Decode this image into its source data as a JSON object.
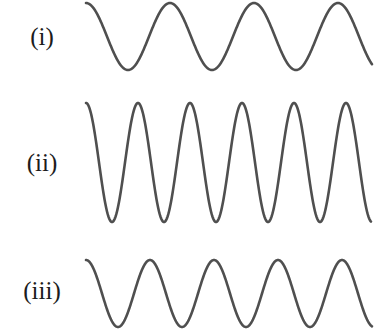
{
  "figure": {
    "width": 388,
    "height": 334,
    "background_color": "#ffffff",
    "stroke_color": "#4f4f4f",
    "label_color": "#1c1c1c",
    "stroke_width": 2.6
  },
  "labels": [
    {
      "id": "i",
      "text": "(i)"
    },
    {
      "id": "ii",
      "text": "(ii)"
    },
    {
      "id": "iii",
      "text": "(iii)"
    }
  ],
  "chart_data": {
    "type": "line",
    "title": "",
    "xlabel": "",
    "ylabel": "",
    "grid": false,
    "legend": "none",
    "axis_visible": false,
    "xlim": [
      86,
      372
    ],
    "ylim": [
      0,
      334
    ],
    "series": [
      {
        "name": "(i)",
        "label": "(i)",
        "phase": "starts at crest",
        "x_start": 86,
        "x_end": 372,
        "center_y": 36.5,
        "amplitude": 33.5,
        "wavelength": 84,
        "cycles": 3.4,
        "peak_y": 3,
        "trough_y": 70,
        "peaks_x": [
          86,
          170,
          254,
          338
        ],
        "troughs_x": [
          128,
          212,
          296
        ],
        "color": "#4f4f4f"
      },
      {
        "name": "(ii)",
        "label": "(ii)",
        "phase": "starts at crest",
        "x_start": 86,
        "x_end": 371,
        "center_y": 162.5,
        "amplitude": 59.5,
        "wavelength": 52,
        "cycles": 5.48,
        "peak_y": 103,
        "trough_y": 222,
        "peaks_x": [
          86,
          138,
          190,
          242,
          294,
          346
        ],
        "troughs_x": [
          112,
          164,
          216,
          268,
          320,
          372
        ],
        "color": "#4f4f4f"
      },
      {
        "name": "(iii)",
        "label": "(iii)",
        "phase": "starts at crest",
        "x_start": 86,
        "x_end": 372,
        "center_y": 293.5,
        "amplitude": 33.5,
        "wavelength": 64,
        "cycles": 4.47,
        "peak_y": 260,
        "trough_y": 327,
        "peaks_x": [
          86,
          150,
          214,
          278,
          342
        ],
        "troughs_x": [
          118,
          182,
          246,
          310
        ],
        "color": "#4f4f4f"
      }
    ]
  }
}
